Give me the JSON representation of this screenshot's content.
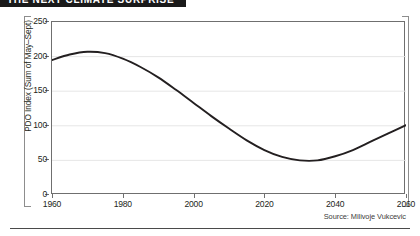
{
  "banner": {
    "title": "THE NEXT CLIMATE SURPRISE"
  },
  "source": {
    "text": "Source: Milivoje Vukcevic"
  },
  "chart_data": {
    "type": "line",
    "title": "THE NEXT CLIMATE SURPRISE",
    "xlabel": "",
    "ylabel": "PDO Index (Sum of May–Sept)",
    "xlim": [
      1960,
      2060
    ],
    "ylim": [
      0,
      250
    ],
    "xticks": [
      1960,
      1980,
      2000,
      2020,
      2040,
      2060
    ],
    "xtick_labels": [
      "1960",
      "1980",
      "2000",
      "2020",
      "2040",
      "2060"
    ],
    "yticks": [
      0,
      50,
      100,
      150,
      200,
      250
    ],
    "ytick_labels": [
      "0",
      "50",
      "100",
      "150",
      "200",
      "250"
    ],
    "grid": "horizontal",
    "legend": "none",
    "series": [
      {
        "name": "PDO Index (Sum of May-Sept)",
        "color": "#231f20",
        "x": [
          1960,
          1965,
          1970,
          1975,
          1980,
          1985,
          1990,
          1995,
          2000,
          2005,
          2010,
          2015,
          2020,
          2025,
          2030,
          2035,
          2040,
          2045,
          2050,
          2055,
          2060
        ],
        "values": [
          195,
          203,
          207,
          205,
          197,
          185,
          170,
          152,
          133,
          114,
          96,
          79,
          65,
          55,
          50,
          50,
          56,
          65,
          77,
          89,
          101
        ]
      }
    ],
    "annotations": [
      "Source: Milivoje Vukcevic"
    ]
  }
}
